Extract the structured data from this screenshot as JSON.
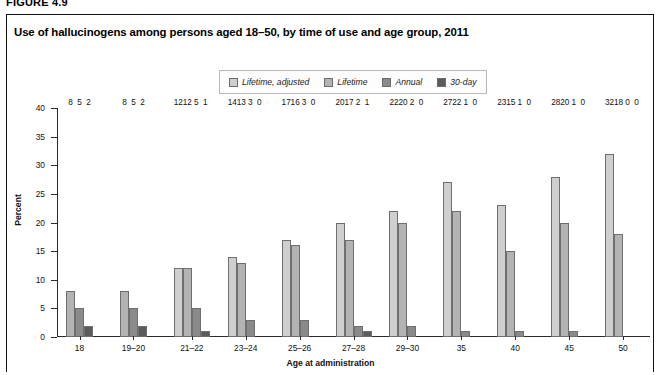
{
  "figure": {
    "label": "FIGURE 4.9",
    "title": "Use of hallucinogens among persons aged 18–50, by time of use and age group, 2011"
  },
  "legend": {
    "position": "top-center",
    "items": [
      {
        "label": "Lifetime, adjusted",
        "color": "#cfcfcf",
        "name": "lifetime-adjusted"
      },
      {
        "label": "Lifetime",
        "color": "#b3b3b3",
        "name": "lifetime"
      },
      {
        "label": "Annual",
        "color": "#8a8a8a",
        "name": "annual"
      },
      {
        "label": "30-day",
        "color": "#5b5b5b",
        "name": "thirty-day"
      }
    ]
  },
  "chart_data": {
    "type": "bar",
    "title": "Use of hallucinogens among persons aged 18–50, by time of use and age group, 2011",
    "xlabel": "Age at administration",
    "ylabel": "Percent",
    "ylim": [
      0,
      40
    ],
    "yticks": [
      0,
      5,
      10,
      15,
      20,
      25,
      30,
      35,
      40
    ],
    "grid": false,
    "legend_position": "top-center",
    "categories": [
      "18",
      "19–20",
      "21–22",
      "23–24",
      "25–26",
      "27–28",
      "29–30",
      "35",
      "40",
      "45",
      "50"
    ],
    "series": [
      {
        "name": "Lifetime, adjusted",
        "color": "#cfcfcf",
        "values": [
          null,
          null,
          12,
          14,
          17,
          20,
          22,
          27,
          23,
          28,
          32
        ]
      },
      {
        "name": "Lifetime",
        "color": "#b3b3b3",
        "values": [
          8,
          8,
          12,
          13,
          16,
          17,
          20,
          22,
          15,
          20,
          18
        ]
      },
      {
        "name": "Annual",
        "color": "#8a8a8a",
        "values": [
          5,
          5,
          5,
          3,
          3,
          2,
          2,
          1,
          1,
          1,
          0
        ]
      },
      {
        "name": "30-day",
        "color": "#5b5b5b",
        "values": [
          2,
          2,
          1,
          0,
          0,
          1,
          0,
          0,
          0,
          0,
          0
        ]
      }
    ]
  }
}
